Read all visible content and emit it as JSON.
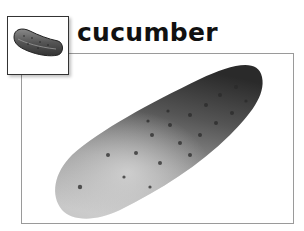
{
  "card": {
    "title": "cucumber",
    "icon": "cucumber-illustration-icon",
    "photo": "cucumber-photo"
  },
  "colors": {
    "frame_border": "#9a9a9a",
    "icon_border": "#333333",
    "title": "#111111",
    "background": "#ffffff"
  }
}
